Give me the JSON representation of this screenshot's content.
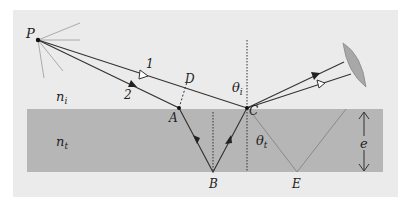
{
  "figure": {
    "colors": {
      "panel": "#ebebeb",
      "slab": "#b6b6b6",
      "ray": "#333333",
      "ghost_ray": "#8a8a8a",
      "lens": "#a8a8a8"
    },
    "labels": {
      "source": "P",
      "ray1": "1",
      "ray2": "2",
      "point_a": "A",
      "point_b": "B",
      "point_c": "C",
      "point_d": "D",
      "point_e": "E",
      "n_incident": "n",
      "n_incident_sub": "i",
      "n_transmitted": "n",
      "n_transmitted_sub": "t",
      "theta_incident": "θ",
      "theta_incident_sub": "i",
      "theta_transmitted": "θ",
      "theta_transmitted_sub": "t",
      "thickness": "e"
    }
  }
}
